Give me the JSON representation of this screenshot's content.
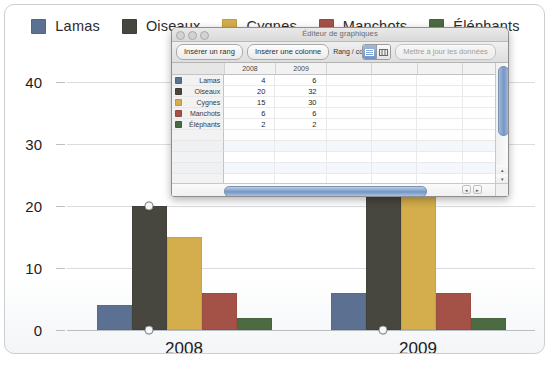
{
  "legend": {
    "items": [
      {
        "label": "Lamas",
        "color": "#5c7192"
      },
      {
        "label": "Oiseaux",
        "color": "#47473f"
      },
      {
        "label": "Cygnes",
        "color": "#d4ad4c"
      },
      {
        "label": "Manchots",
        "color": "#a45248"
      },
      {
        "label": "Éléphants",
        "color": "#4c6b42"
      }
    ]
  },
  "chart_data": {
    "type": "bar",
    "title": "",
    "xlabel": "",
    "ylabel": "",
    "categories": [
      "2008",
      "2009"
    ],
    "ylim": [
      0,
      45
    ],
    "yticks": [
      0,
      10,
      20,
      30,
      40
    ],
    "ytick_labels": [
      "0",
      "10",
      "20",
      "30",
      "40"
    ],
    "grid": true,
    "legend_position": "top",
    "series": [
      {
        "name": "Lamas",
        "color": "#5c7192",
        "values": [
          4,
          6
        ]
      },
      {
        "name": "Oiseaux",
        "color": "#47473f",
        "values": [
          20,
          32
        ]
      },
      {
        "name": "Cygnes",
        "color": "#d4ad4c",
        "values": [
          15,
          30
        ]
      },
      {
        "name": "Manchots",
        "color": "#a45248",
        "values": [
          6,
          6
        ]
      },
      {
        "name": "Éléphants",
        "color": "#4c6b42",
        "values": [
          2,
          2
        ]
      }
    ]
  },
  "editor": {
    "title": "Éditeur de graphiques",
    "toolbar": {
      "insert_row": "Insérer un rang",
      "insert_column": "Insérer une colonne",
      "rang_colonne_label": "Rang / colonne",
      "segment_rows_icon": "rows-grid-icon",
      "segment_columns_icon": "columns-grid-icon",
      "update_data": "Mettre à jour les données"
    },
    "table": {
      "corner_header": "",
      "column_headers": [
        "2008",
        "2009",
        "",
        "",
        "",
        ""
      ],
      "rows": [
        {
          "label": "Lamas",
          "color": "#5c7192",
          "values": [
            "4",
            "6"
          ]
        },
        {
          "label": "Oiseaux",
          "color": "#47473f",
          "values": [
            "20",
            "32"
          ]
        },
        {
          "label": "Cygnes",
          "color": "#d4ad4c",
          "values": [
            "15",
            "30"
          ]
        },
        {
          "label": "Manchots",
          "color": "#a45248",
          "values": [
            "6",
            "6"
          ]
        },
        {
          "label": "Éléphants",
          "color": "#4c6b42",
          "values": [
            "2",
            "2"
          ]
        }
      ],
      "empty_row_count": 8
    },
    "window_buttons": [
      "close-button",
      "minimize-button",
      "zoom-button"
    ]
  },
  "caption": ""
}
